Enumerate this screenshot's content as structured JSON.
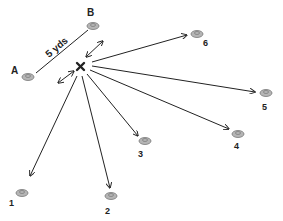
{
  "diagram": {
    "type": "drill",
    "distance_label": "5 yds",
    "center_marker": "X",
    "start_cones": [
      {
        "id": "A",
        "label": "A",
        "x": 28,
        "y": 76,
        "lx": 11,
        "ly": 74
      },
      {
        "id": "B",
        "label": "B",
        "x": 93,
        "y": 26,
        "lx": 87,
        "ly": 16
      }
    ],
    "target_cones": [
      {
        "id": "1",
        "label": "1",
        "x": 22,
        "y": 193,
        "lx": 9,
        "ly": 206,
        "tip": [
          30,
          176
        ]
      },
      {
        "id": "2",
        "label": "2",
        "x": 111,
        "y": 196,
        "lx": 105,
        "ly": 214,
        "tip": [
          110,
          188
        ]
      },
      {
        "id": "3",
        "label": "3",
        "x": 145,
        "y": 141,
        "lx": 138,
        "ly": 157,
        "tip": [
          138,
          136
        ]
      },
      {
        "id": "4",
        "label": "4",
        "x": 238,
        "y": 133,
        "lx": 234,
        "ly": 149,
        "tip": [
          229,
          129
        ]
      },
      {
        "id": "5",
        "label": "5",
        "x": 265,
        "y": 93,
        "lx": 262,
        "ly": 110,
        "tip": [
          255,
          92
        ]
      },
      {
        "id": "6",
        "label": "6",
        "x": 197,
        "y": 34,
        "lx": 203,
        "ly": 46,
        "tip": [
          187,
          35
        ]
      }
    ],
    "colors": {
      "line": "#222222",
      "cone_fill": "#b5b5b5",
      "cone_stroke": "#777777"
    }
  }
}
